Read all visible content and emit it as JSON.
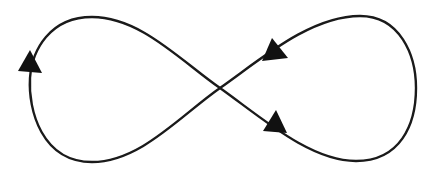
{
  "diagram": {
    "type": "figure-eight-loop",
    "description": "Infinity / figure-eight closed loop with directional arrows",
    "colors": {
      "stroke": "#1a1a1a",
      "arrow": "#111111",
      "background": "#ffffff"
    },
    "crossing_point": {
      "x": 220,
      "y": 88
    },
    "loops": [
      {
        "id": "left-loop",
        "leftmost_x": 29,
        "top_y": 17,
        "bottom_y": 162
      },
      {
        "id": "right-loop",
        "rightmost_x": 416,
        "top_y": 16,
        "bottom_y": 161
      }
    ],
    "arrows": [
      {
        "id": "arrow-left-loop",
        "position": {
          "x": 30,
          "y": 62
        },
        "direction": "up"
      },
      {
        "id": "arrow-upper-right-branch",
        "position": {
          "x": 271,
          "y": 53
        },
        "direction": "down-left"
      },
      {
        "id": "arrow-lower-right-branch",
        "position": {
          "x": 277,
          "y": 124
        },
        "direction": "down-right"
      }
    ]
  }
}
